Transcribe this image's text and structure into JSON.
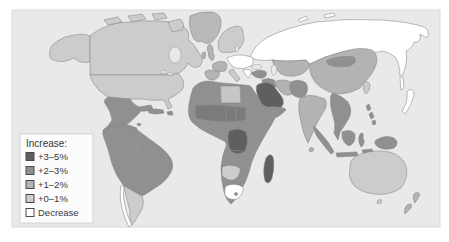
{
  "figure": {
    "type": "world-choropleth-population-change-map",
    "ocean_color": "#e9e9e9",
    "panel_border_color": "#d9d9d9"
  },
  "legend": {
    "title": "Increase:",
    "box_color": "#fcfcfc",
    "items": [
      {
        "label": "+3–5%",
        "color": "#5f5f5f"
      },
      {
        "label": "+2–3%",
        "color": "#909090"
      },
      {
        "label": "+1–2%",
        "color": "#b3b3b3"
      },
      {
        "label": "+0–1%",
        "color": "#cccccc"
      },
      {
        "label": "Decrease",
        "color": "#ffffff"
      }
    ]
  },
  "map": {
    "regions": {
      "alaska": {
        "category": "+0–1%",
        "color": "#cccccc"
      },
      "canada": {
        "category": "+0–1%",
        "color": "#cccccc"
      },
      "arctic-islands": {
        "category": "+0–1%",
        "color": "#cccccc"
      },
      "greenland": {
        "category": "+1–2%",
        "color": "#b9b9b9"
      },
      "usa": {
        "category": "+0–1%",
        "color": "#cccccc"
      },
      "mexico-central-america": {
        "category": "+2–3%",
        "color": "#909090"
      },
      "cuba": {
        "category": "+2–3%",
        "color": "#909090"
      },
      "hispaniola": {
        "category": "+2–3%",
        "color": "#909090"
      },
      "lesser-antilles": {
        "category": "+2–3%",
        "color": "#909090"
      },
      "south-america-north": {
        "category": "+2–3%",
        "color": "#909090"
      },
      "argentina": {
        "category": "+0–1%",
        "color": "#cccccc"
      },
      "chile": {
        "category": "Decrease",
        "color": "#ffffff"
      },
      "iceland": {
        "category": "+0–1%",
        "color": "#cccccc"
      },
      "uk": {
        "category": "+1–2%",
        "color": "#b3b3b3"
      },
      "ireland": {
        "category": "+1–2%",
        "color": "#b3b3b3"
      },
      "scandinavia": {
        "category": "+0–1%",
        "color": "#cccccc"
      },
      "france": {
        "category": "+1–2%",
        "color": "#b3b3b3"
      },
      "iberia": {
        "category": "+1–2%",
        "color": "#b3b3b3"
      },
      "central-europe": {
        "category": "Decrease",
        "color": "#ffffff"
      },
      "italy": {
        "category": "+0–1%",
        "color": "#cccccc"
      },
      "balkans": {
        "category": "Decrease",
        "color": "#ffffff"
      },
      "russia": {
        "category": "Decrease",
        "color": "#ffffff"
      },
      "russia-arctic-islands": {
        "category": "Decrease",
        "color": "#ffffff"
      },
      "sakhalin": {
        "category": "Decrease",
        "color": "#ffffff"
      },
      "central-asia": {
        "category": "+1–2%",
        "color": "#b3b3b3"
      },
      "turkey": {
        "category": "+2–3%",
        "color": "#909090"
      },
      "levant-iraq": {
        "category": "+2–3%",
        "color": "#909090"
      },
      "arabia": {
        "category": "+3–5%",
        "color": "#5f5f5f"
      },
      "iran": {
        "category": "+1–2%",
        "color": "#b3b3b3"
      },
      "afghanistan-pakistan": {
        "category": "+2–3%",
        "color": "#909090"
      },
      "india": {
        "category": "+1–2%",
        "color": "#b3b3b3"
      },
      "sri-lanka": {
        "category": "+1–2%",
        "color": "#b3b3b3"
      },
      "china": {
        "category": "+1–2%",
        "color": "#b3b3b3"
      },
      "mongolia": {
        "category": "+2–3%",
        "color": "#909090"
      },
      "korea": {
        "category": "+0–1%",
        "color": "#cccccc"
      },
      "japan": {
        "category": "Decrease",
        "color": "#ffffff"
      },
      "southeast-asia": {
        "category": "+2–3%",
        "color": "#909090"
      },
      "philippines": {
        "category": "+2–3%",
        "color": "#909090"
      },
      "indonesia": {
        "category": "+2–3%",
        "color": "#909090"
      },
      "new-guinea": {
        "category": "+2–3%",
        "color": "#909090"
      },
      "australia": {
        "category": "+0–1%",
        "color": "#cccccc"
      },
      "tasmania": {
        "category": "+0–1%",
        "color": "#cccccc"
      },
      "new-zealand": {
        "category": "+1–2%",
        "color": "#b3b3b3"
      },
      "africa": {
        "category": "+2–3%",
        "color": "#909090"
      },
      "sahel": {
        "category": "+3–5%",
        "color": "#7b7b7b"
      },
      "libya": {
        "category": "+0–1%",
        "color": "#c6c6c6"
      },
      "dr-congo": {
        "category": "+3–5%",
        "color": "#5f5f5f"
      },
      "namibia-botswana": {
        "category": "+0–1%",
        "color": "#cccccc"
      },
      "south-africa": {
        "category": "Decrease",
        "color": "#ffffff"
      },
      "lesotho": {
        "category": "+2–3%",
        "color": "#909090"
      },
      "madagascar": {
        "category": "+3–5%",
        "color": "#5f5f5f"
      }
    }
  }
}
